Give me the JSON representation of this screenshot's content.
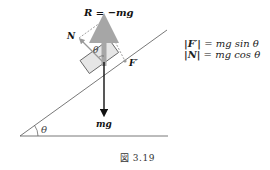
{
  "figure": {
    "caption": "図 3.19",
    "labels": {
      "resultant": "R = −mg",
      "normal": "N",
      "friction": "F′",
      "weight": "mg",
      "angle_block": "θ",
      "angle_incline": "θ"
    },
    "formulas": [
      {
        "lhs": "|F′|",
        "rhs": "= mg sin θ"
      },
      {
        "lhs": "|N|",
        "rhs": "= mg cos θ"
      }
    ],
    "colors": {
      "line": "#555555",
      "gray_arrow": "#a6a6a6",
      "black_arrow": "#111111",
      "block_fill": "#e6e6e6",
      "dashed": "#777777"
    }
  }
}
